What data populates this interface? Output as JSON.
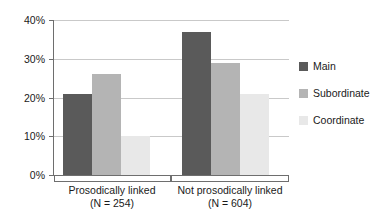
{
  "chart_data": {
    "type": "bar",
    "title": "",
    "subtitle": "",
    "xlabel": "",
    "ylabel": "",
    "grid": true,
    "legend_position": "right",
    "ylim": [
      0,
      40
    ],
    "yticks": [
      "0%",
      "10%",
      "20%",
      "30%",
      "40%"
    ],
    "ytick_values": [
      0,
      10,
      20,
      30,
      40
    ],
    "categories": [
      "Prosodically linked",
      "Not prosodically linked"
    ],
    "category_sublabels": [
      "(N = 254)",
      "(N = 604)"
    ],
    "series": [
      {
        "name": "Main",
        "color": "#5a5a5a",
        "values": [
          21,
          37
        ]
      },
      {
        "name": "Subordinate",
        "color": "#b4b4b4",
        "values": [
          26,
          29
        ]
      },
      {
        "name": "Coordinate",
        "color": "#e8e8e8",
        "values": [
          10,
          21
        ]
      }
    ]
  },
  "axis": {
    "yticks": [
      {
        "label": "40%",
        "value": 40
      },
      {
        "label": "30%",
        "value": 30
      },
      {
        "label": "20%",
        "value": 20
      },
      {
        "label": "10%",
        "value": 10
      },
      {
        "label": "0%",
        "value": 0
      }
    ]
  },
  "categories": [
    {
      "label": "Prosodically linked",
      "sublabel": "(N = 254)"
    },
    {
      "label": "Not prosodically linked",
      "sublabel": "(N = 604)"
    }
  ],
  "legend": {
    "items": [
      {
        "label": "Main",
        "color": "#5a5a5a"
      },
      {
        "label": "Subordinate",
        "color": "#b4b4b4"
      },
      {
        "label": "Coordinate",
        "color": "#e8e8e8"
      }
    ]
  }
}
